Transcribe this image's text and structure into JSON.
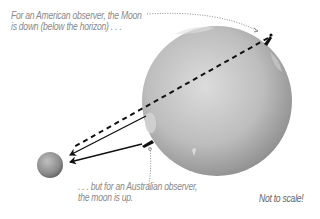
{
  "diagram": {
    "earth": {
      "label": "Earth",
      "cx": 217,
      "cy": 101,
      "r": 75
    },
    "moon": {
      "label": "Moon",
      "cx": 50,
      "cy": 165,
      "r": 13
    },
    "captions": {
      "american_line1": "For an American observer, the Moon",
      "american_line2": "is down (below the horizon) . . .",
      "australian_line1": ". . . but for an Australian observer,",
      "australian_line2": "the moon is up.",
      "scale_note": "Not to scale!"
    },
    "colors": {
      "earth_light": "#d9d9d9",
      "earth_dark": "#8f8f8f",
      "moon_light": "#b5b5b5",
      "moon_dark": "#6a6a6a",
      "arrow": "#111111",
      "caption": "#8a8a8a"
    }
  }
}
